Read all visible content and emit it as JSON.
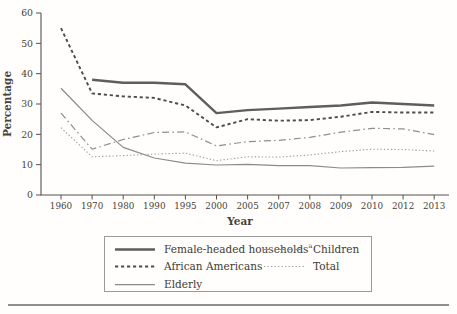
{
  "chart_data": {
    "type": "line",
    "title": "",
    "ylabel": "Percentage",
    "xlabel": "Year",
    "ylim": [
      0,
      60
    ],
    "yticks": [
      0,
      10,
      20,
      30,
      40,
      50,
      60
    ],
    "grid": "off",
    "legend_position": "bottom-boxed",
    "categories": [
      "1960",
      "1970",
      "1980",
      "1990",
      "1995",
      "2000",
      "2005",
      "2007",
      "2008",
      "2009",
      "2010",
      "2012",
      "2013"
    ],
    "colors": {
      "axis": "#55524c",
      "text": "#45423b",
      "legend_border": "#9a9a9a",
      "bottom_rule": "#8f8f8f"
    },
    "series": [
      {
        "name": "Female-headed households",
        "footnote_marker": "a",
        "line_style": "solid-thick",
        "color": "#5e5e5e",
        "stroke_width": 2.4,
        "dasharray": "",
        "values": [
          null,
          38,
          37,
          37,
          36.5,
          27,
          28,
          28.5,
          29,
          29.5,
          30.5,
          30,
          29.5
        ]
      },
      {
        "name": "African Americans",
        "footnote_marker": "",
        "line_style": "dashed",
        "color": "#4c4c4c",
        "stroke_width": 1.9,
        "dasharray": "3.2 2.8",
        "values": [
          55,
          33.5,
          32.5,
          32,
          29.5,
          22.3,
          25,
          24.5,
          24.7,
          25.8,
          27.4,
          27.2,
          27.2
        ]
      },
      {
        "name": "Elderly",
        "footnote_marker": "",
        "line_style": "solid-thin",
        "color": "#8b8b8b",
        "stroke_width": 1.25,
        "dasharray": "",
        "values": [
          35.2,
          24.6,
          15.7,
          12.2,
          10.5,
          9.9,
          10.1,
          9.7,
          9.7,
          8.9,
          9,
          9.1,
          9.5
        ]
      },
      {
        "name": "Children",
        "footnote_marker": "",
        "line_style": "dash-dot",
        "color": "#8e8e8e",
        "stroke_width": 1.2,
        "dasharray": "7 3.2 1.6 3.2",
        "values": [
          27,
          15.1,
          18.3,
          20.6,
          20.8,
          16.2,
          17.6,
          18,
          19,
          20.7,
          22,
          21.8,
          19.9
        ]
      },
      {
        "name": "Total",
        "footnote_marker": "",
        "line_style": "dotted",
        "color": "#9b9b9b",
        "stroke_width": 1.1,
        "dasharray": "1.3 2.2",
        "values": [
          22.2,
          12.6,
          13,
          13.5,
          13.8,
          11.3,
          12.6,
          12.5,
          13.2,
          14.3,
          15.1,
          15,
          14.5
        ]
      }
    ],
    "legend_columns": [
      [
        0,
        1,
        2
      ],
      [
        3,
        4
      ]
    ]
  }
}
